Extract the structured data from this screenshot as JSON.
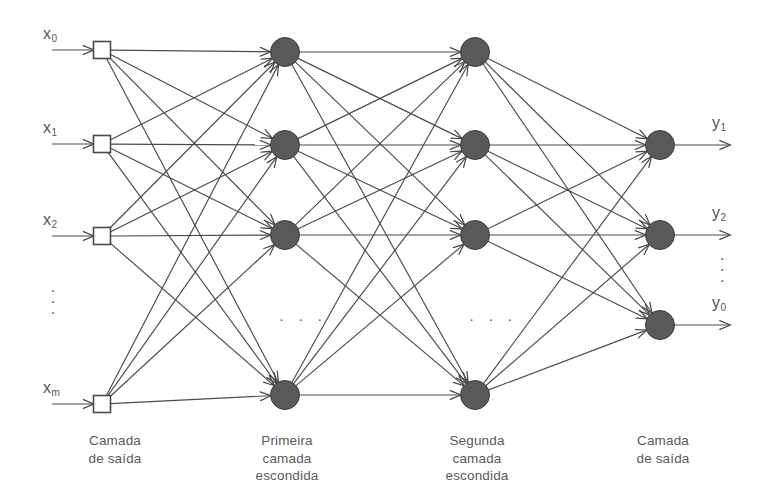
{
  "figure": {
    "type": "neural-network-diagram",
    "background_color": "#ffffff",
    "line_color": "#4a4a4a",
    "node_fill_color": "#595959",
    "node_stroke_color": "#3c3c3c",
    "input_box_fill": "#ffffff",
    "input_box_stroke": "#4a4a4a",
    "text_color": "#5a5a5a"
  },
  "inputs": {
    "labels": [
      "x",
      "x",
      "x",
      "x"
    ],
    "subscripts": [
      "0",
      "1",
      "2",
      "m"
    ],
    "ellipsis": "·\n·\n·",
    "items": [
      {
        "label": "x",
        "sub": "0",
        "y": 50
      },
      {
        "label": "x",
        "sub": "1",
        "y": 144
      },
      {
        "label": "x",
        "sub": "2",
        "y": 236
      },
      {
        "label": "x",
        "sub": "m",
        "y": 404
      }
    ]
  },
  "outputs": {
    "items": [
      {
        "label": "y",
        "sub": "1",
        "y": 145
      },
      {
        "label": "y",
        "sub": "2",
        "y": 235
      },
      {
        "label": "y",
        "sub": "0",
        "y": 325
      }
    ],
    "ellipsis": "·\n·\n·"
  },
  "layers": [
    {
      "id": "input-layer",
      "caption": "Camada\nde saída",
      "caption_x": 60,
      "caption_y": 432,
      "node_shape": "square",
      "node_count": 4,
      "x": 102,
      "node_y": [
        50,
        144,
        236,
        404
      ]
    },
    {
      "id": "first-hidden-layer",
      "caption": "Primeira\ncamada\nescondida",
      "caption_x": 232,
      "caption_y": 432,
      "node_shape": "circle",
      "node_count": 4,
      "x": 285,
      "node_y": [
        52,
        145,
        235,
        395
      ]
    },
    {
      "id": "second-hidden-layer",
      "caption": "Segunda\ncamada\nescondida",
      "caption_x": 422,
      "caption_y": 432,
      "node_shape": "circle",
      "node_count": 4,
      "x": 475,
      "node_y": [
        52,
        145,
        235,
        395
      ]
    },
    {
      "id": "output-layer",
      "caption": "Camada\nde saída",
      "caption_x": 608,
      "caption_y": 432,
      "node_shape": "circle",
      "node_count": 3,
      "x": 660,
      "node_y": [
        145,
        235,
        325
      ]
    }
  ],
  "layer_ellipsis": {
    "first_hidden": {
      "text": "·  ·  ·",
      "x": 296,
      "y": 322
    },
    "second_hidden": {
      "text": "·  ·  ·",
      "x": 486,
      "y": 322
    }
  },
  "connections": {
    "fully_connected": true,
    "arrow_head": "open-v",
    "description": "Cada nó de uma camada conecta-se a todos os nós da camada seguinte"
  }
}
